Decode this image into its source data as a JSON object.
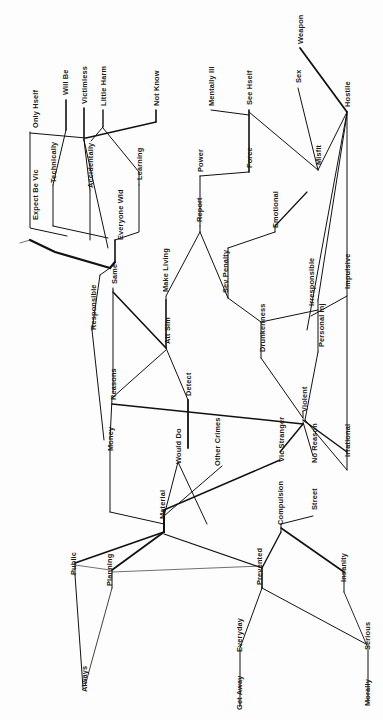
{
  "figure": {
    "type": "dendrogram",
    "orientation": "rotated-90",
    "background_color": "#fdfdfd",
    "line_color": "#111111",
    "label_color": "#1a1a1a"
  },
  "chart_data": {
    "type": "table",
    "title": "",
    "xlabel": "",
    "ylabel": "",
    "grid": false,
    "legend": "none",
    "leaves": [
      "Only Hself",
      "Will Be",
      "Victimless",
      "Little Harm",
      "Not Know",
      "Mentally Ill",
      "See Hself",
      "Sex",
      "Weapon",
      "Expect Be Vic",
      "Technically",
      "Accidentally",
      "Learning",
      "Power",
      "Force",
      "Misfit",
      "Hostile",
      "Everyone Wld",
      "Report",
      "Emotional",
      "Responsible",
      "Same",
      "Make Living",
      "Sev Penalty",
      "Irresponsible",
      "Impulsive",
      "Att Sim",
      "Drunkenness",
      "Personal Inj",
      "Reasons",
      "Detect",
      "Violent",
      "Money",
      "Would Do",
      "Other Crimes",
      "Vic Stranger",
      "No Reason",
      "Irrational",
      "Material",
      "Compulsion",
      "Street",
      "Insanity",
      "Public",
      "Planning",
      "Prevented",
      "Everyday",
      "Serious",
      "Always",
      "Get Away",
      "Morally"
    ],
    "labels": [
      {
        "id": "only-hself",
        "text": "Only Hself",
        "x": 32,
        "y": 128
      },
      {
        "id": "will-be",
        "text": "Will Be",
        "x": 62,
        "y": 95
      },
      {
        "id": "victimless",
        "text": "Victimless",
        "x": 81,
        "y": 104
      },
      {
        "id": "little-harm",
        "text": "Little Harm",
        "x": 100,
        "y": 106
      },
      {
        "id": "not-know",
        "text": "Not Know",
        "x": 153,
        "y": 106
      },
      {
        "id": "mentally-ill",
        "text": "Mentally Ill",
        "x": 208,
        "y": 106
      },
      {
        "id": "see-hself",
        "text": "See Hself",
        "x": 246,
        "y": 105
      },
      {
        "id": "sex",
        "text": "Sex",
        "x": 295,
        "y": 83
      },
      {
        "id": "weapon",
        "text": "Weapon",
        "x": 297,
        "y": 44
      },
      {
        "id": "expect-be-vic",
        "text": "Expect Be Vic",
        "x": 32,
        "y": 220
      },
      {
        "id": "technically",
        "text": "Technically",
        "x": 50,
        "y": 183
      },
      {
        "id": "accidentally",
        "text": "Accidentally",
        "x": 87,
        "y": 188
      },
      {
        "id": "learning",
        "text": "Learning",
        "x": 136,
        "y": 180
      },
      {
        "id": "power",
        "text": "Power",
        "x": 197,
        "y": 172
      },
      {
        "id": "force",
        "text": "Force",
        "x": 246,
        "y": 168
      },
      {
        "id": "misfit",
        "text": "Misfit",
        "x": 315,
        "y": 165
      },
      {
        "id": "hostile",
        "text": "Hostile",
        "x": 344,
        "y": 107
      },
      {
        "id": "everyone-wld",
        "text": "Everyone Wld",
        "x": 117,
        "y": 240
      },
      {
        "id": "report",
        "text": "Report",
        "x": 196,
        "y": 222
      },
      {
        "id": "emotional",
        "text": "Emotional",
        "x": 272,
        "y": 228
      },
      {
        "id": "responsible",
        "text": "Responsible",
        "x": 90,
        "y": 330
      },
      {
        "id": "same",
        "text": "Same",
        "x": 111,
        "y": 284
      },
      {
        "id": "make-living",
        "text": "Make Living",
        "x": 162,
        "y": 292
      },
      {
        "id": "sev-penalty",
        "text": "Sev Penalty",
        "x": 222,
        "y": 293
      },
      {
        "id": "irresponsible",
        "text": "Irresponsible",
        "x": 308,
        "y": 306
      },
      {
        "id": "impulsive",
        "text": "Impulsive",
        "x": 344,
        "y": 289
      },
      {
        "id": "att-sim",
        "text": "Att Sim",
        "x": 164,
        "y": 344
      },
      {
        "id": "drunkenness",
        "text": "Drunkenness",
        "x": 259,
        "y": 352
      },
      {
        "id": "personal-inj",
        "text": "Personal Inj",
        "x": 318,
        "y": 347
      },
      {
        "id": "reasons",
        "text": "Reasons",
        "x": 110,
        "y": 400
      },
      {
        "id": "detect",
        "text": "Detect",
        "x": 185,
        "y": 396
      },
      {
        "id": "violent",
        "text": "Violent",
        "x": 301,
        "y": 412
      },
      {
        "id": "money",
        "text": "Money",
        "x": 107,
        "y": 451
      },
      {
        "id": "would-do",
        "text": "Would Do",
        "x": 175,
        "y": 464
      },
      {
        "id": "other-crimes",
        "text": "Other Crimes",
        "x": 214,
        "y": 466
      },
      {
        "id": "vic-stranger",
        "text": "Vic Stranger",
        "x": 278,
        "y": 462
      },
      {
        "id": "no-reason",
        "text": "No Reason",
        "x": 311,
        "y": 463
      },
      {
        "id": "irrational",
        "text": "Irrational",
        "x": 344,
        "y": 457
      },
      {
        "id": "material",
        "text": "Material",
        "x": 159,
        "y": 519
      },
      {
        "id": "compulsion",
        "text": "Compulsion",
        "x": 277,
        "y": 525
      },
      {
        "id": "street",
        "text": "Street",
        "x": 311,
        "y": 510
      },
      {
        "id": "insanity",
        "text": "Insanity",
        "x": 340,
        "y": 582
      },
      {
        "id": "public",
        "text": "Public",
        "x": 70,
        "y": 575
      },
      {
        "id": "planning",
        "text": "Planning",
        "x": 106,
        "y": 586
      },
      {
        "id": "prevented",
        "text": "Prevented",
        "x": 256,
        "y": 585
      },
      {
        "id": "everyday",
        "text": "Everyday",
        "x": 236,
        "y": 652
      },
      {
        "id": "serious",
        "text": "Serious",
        "x": 364,
        "y": 650
      },
      {
        "id": "always",
        "text": "Always",
        "x": 81,
        "y": 692
      },
      {
        "id": "get-away",
        "text": "Get Away",
        "x": 236,
        "y": 710
      },
      {
        "id": "morally",
        "text": "Morally",
        "x": 364,
        "y": 706
      }
    ],
    "branches": [
      {
        "id": "b01",
        "points": "30,132 30,228 67,236",
        "w": 1.0
      },
      {
        "id": "b02",
        "points": "66,100 66,130",
        "w": 1.6
      },
      {
        "id": "b03",
        "points": "66,130 53,185",
        "w": 1.0
      },
      {
        "id": "b04",
        "points": "53,185 53,226",
        "w": 1.0
      },
      {
        "id": "b05",
        "points": "53,226 108,238",
        "w": 1.0
      },
      {
        "id": "b06",
        "points": "84,108 84,140",
        "w": 1.6
      },
      {
        "id": "b07",
        "points": "84,140 90,190",
        "w": 1.0
      },
      {
        "id": "b08",
        "points": "90,190 90,240",
        "w": 1.0
      },
      {
        "id": "b09",
        "points": "84,140 108,248",
        "w": 1.0
      },
      {
        "id": "b10",
        "points": "103,110 103,127",
        "w": 1.4
      },
      {
        "id": "b11",
        "points": "103,127 91,141",
        "w": 1.0
      },
      {
        "id": "b12",
        "points": "156,110 156,122",
        "w": 1.6
      },
      {
        "id": "b13",
        "points": "156,122 86,138",
        "w": 1.3
      },
      {
        "id": "b14",
        "points": "86,138 30,133",
        "w": 1.0
      },
      {
        "id": "b15",
        "points": "139,185 139,172 103,128",
        "w": 1.0
      },
      {
        "id": "b16",
        "points": "139,185 139,232 115,240",
        "w": 1.0
      },
      {
        "id": "b17",
        "points": "115,240 115,262",
        "w": 1.6
      },
      {
        "id": "b18",
        "points": "115,262 110,268",
        "w": 2.2
      },
      {
        "id": "b19",
        "points": "110,268 55,252 30,240",
        "w": 2.2
      },
      {
        "id": "b20",
        "points": "110,268 100,275",
        "w": 1.0
      },
      {
        "id": "b21",
        "points": "100,275 92,330",
        "w": 1.0
      },
      {
        "id": "b22",
        "points": "92,330 104,440",
        "w": 1.0
      },
      {
        "id": "b23",
        "points": "113,290 113,392",
        "w": 1.0
      },
      {
        "id": "b24",
        "points": "113,290 113,288",
        "w": 1.0
      },
      {
        "id": "b25",
        "points": "113,292 166,348",
        "w": 1.6
      },
      {
        "id": "b26",
        "points": "166,348 166,300",
        "w": 1.6
      },
      {
        "id": "b27",
        "points": "166,300 166,296 200,232",
        "w": 1.0
      },
      {
        "id": "b28",
        "points": "200,232 200,226",
        "w": 1.0
      },
      {
        "id": "b29",
        "points": "200,226 200,176",
        "w": 1.0
      },
      {
        "id": "b30",
        "points": "200,176 249,172",
        "w": 1.0
      },
      {
        "id": "b31",
        "points": "249,172 249,110",
        "w": 1.6
      },
      {
        "id": "b32",
        "points": "249,115 211,110",
        "w": 1.0
      },
      {
        "id": "b33",
        "points": "249,112 318,170",
        "w": 1.0
      },
      {
        "id": "b34",
        "points": "318,170 298,88",
        "w": 1.0
      },
      {
        "id": "b35",
        "points": "318,170 347,112",
        "w": 1.0
      },
      {
        "id": "b36",
        "points": "347,112 300,48",
        "w": 1.8
      },
      {
        "id": "b37",
        "points": "347,112 347,470",
        "w": 1.0
      },
      {
        "id": "b38",
        "points": "347,112 307,330",
        "w": 1.0
      },
      {
        "id": "b39",
        "points": "347,114 318,300",
        "w": 1.0
      },
      {
        "id": "b40",
        "points": "318,300 318,352",
        "w": 1.0
      },
      {
        "id": "b41",
        "points": "318,352 305,420",
        "w": 1.0
      },
      {
        "id": "b42",
        "points": "200,232 228,298",
        "w": 1.0
      },
      {
        "id": "b43",
        "points": "228,298 228,248",
        "w": 1.0
      },
      {
        "id": "b44",
        "points": "228,248 275,232",
        "w": 1.0
      },
      {
        "id": "b45",
        "points": "275,232 275,226",
        "w": 1.0
      },
      {
        "id": "b46",
        "points": "275,226 307,192",
        "w": 1.2
      },
      {
        "id": "b47",
        "points": "228,298 261,322",
        "w": 1.0
      },
      {
        "id": "b48",
        "points": "261,322 318,310",
        "w": 1.0
      },
      {
        "id": "b49",
        "points": "311,316 347,296",
        "w": 1.0
      },
      {
        "id": "b50",
        "points": "261,322 261,358",
        "w": 1.0
      },
      {
        "id": "b51",
        "points": "261,358 303,418",
        "w": 1.0
      },
      {
        "id": "b52",
        "points": "303,418 303,412",
        "w": 1.0
      },
      {
        "id": "b53",
        "points": "166,348 188,400",
        "w": 1.0
      },
      {
        "id": "b54",
        "points": "188,400 188,448",
        "w": 1.8
      },
      {
        "id": "b55",
        "points": "166,350 112,398",
        "w": 1.0
      },
      {
        "id": "b56",
        "points": "112,398 110,440",
        "w": 1.0
      },
      {
        "id": "b57",
        "points": "112,404 303,424",
        "w": 1.5
      },
      {
        "id": "b58",
        "points": "303,424 280,452",
        "w": 1.5
      },
      {
        "id": "b59",
        "points": "303,422 313,456",
        "w": 1.0
      },
      {
        "id": "b60",
        "points": "303,420 347,452",
        "w": 1.5
      },
      {
        "id": "b61",
        "points": "110,442 110,512",
        "w": 1.0
      },
      {
        "id": "b62",
        "points": "110,512 164,524",
        "w": 1.0
      },
      {
        "id": "b63",
        "points": "164,524 164,510",
        "w": 2.0
      },
      {
        "id": "b64",
        "points": "164,510 280,460",
        "w": 1.5
      },
      {
        "id": "b65",
        "points": "164,516 222,466",
        "w": 1.0
      },
      {
        "id": "b66",
        "points": "164,516 178,462",
        "w": 1.0
      },
      {
        "id": "b67",
        "points": "178,462 207,524",
        "w": 1.0
      },
      {
        "id": "b68",
        "points": "164,524 164,532",
        "w": 2.0
      },
      {
        "id": "b69",
        "points": "164,532 75,563",
        "w": 1.8
      },
      {
        "id": "b70",
        "points": "75,563 75,575",
        "w": 1.0
      },
      {
        "id": "b71",
        "points": "75,575 83,688",
        "w": 1.0
      },
      {
        "id": "b72",
        "points": "164,532 112,570",
        "w": 1.8
      },
      {
        "id": "b73",
        "points": "112,570 112,588",
        "w": 1.0
      },
      {
        "id": "b74",
        "points": "112,588 85,686",
        "w": 0.8
      },
      {
        "id": "b75",
        "points": "164,534 262,568",
        "w": 1.2
      },
      {
        "id": "b76",
        "points": "262,568 262,588",
        "w": 1.6
      },
      {
        "id": "b77",
        "points": "262,568 281,532",
        "w": 1.4
      },
      {
        "id": "b78",
        "points": "281,532 281,524",
        "w": 1.0
      },
      {
        "id": "b79",
        "points": "281,524 313,516",
        "w": 1.0
      },
      {
        "id": "b80",
        "points": "281,528 344,572",
        "w": 1.6
      },
      {
        "id": "b81",
        "points": "344,572 344,592",
        "w": 1.0
      },
      {
        "id": "b82",
        "points": "344,592 368,648",
        "w": 0.9
      },
      {
        "id": "b83",
        "points": "262,588 240,648",
        "w": 1.0
      },
      {
        "id": "b84",
        "points": "262,588 366,644",
        "w": 1.0
      },
      {
        "id": "b85",
        "points": "240,650 240,706",
        "w": 1.0
      },
      {
        "id": "b86",
        "points": "368,650 368,702",
        "w": 1.0
      },
      {
        "id": "b87",
        "points": "75,565 110,570",
        "w": 0.6
      },
      {
        "id": "b88",
        "points": "112,572 262,566",
        "w": 0.6
      },
      {
        "id": "b89",
        "points": "30,240 20,243",
        "w": 0.6
      },
      {
        "id": "b90",
        "points": "305,420 347,470",
        "w": 1.0
      }
    ]
  }
}
